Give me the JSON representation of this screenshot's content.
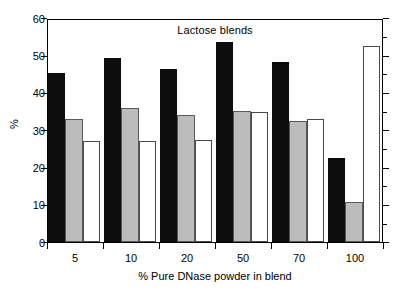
{
  "chart_data": {
    "type": "bar",
    "title": "Lactose blends",
    "xlabel": "% Pure DNase powder in blend",
    "ylabel": "%",
    "categories": [
      "5",
      "10",
      "20",
      "50",
      "70",
      "100"
    ],
    "series": [
      {
        "name": "black",
        "color": "#0d0d0d",
        "values": [
          45.2,
          49.2,
          46.3,
          53.5,
          48.2,
          22.6
        ]
      },
      {
        "name": "gray",
        "color": "#bcbcbc",
        "values": [
          32.9,
          35.8,
          33.9,
          35.0,
          32.4,
          10.6
        ]
      },
      {
        "name": "white",
        "color": "#ffffff",
        "values": [
          27.1,
          27.0,
          27.3,
          34.7,
          32.9,
          52.4
        ]
      }
    ],
    "ylim": [
      0,
      60
    ],
    "yticks": [
      0,
      10,
      20,
      30,
      40,
      50,
      60
    ],
    "ytick_labels": [
      "0",
      "10",
      "20",
      "30",
      "40",
      "50",
      "60"
    ],
    "grid": false,
    "legend": "none",
    "right_axis_ticks": true
  }
}
